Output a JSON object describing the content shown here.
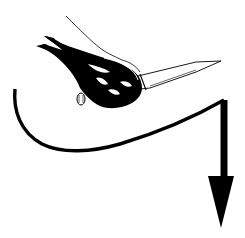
{
  "image": {
    "description": "Pictogram: hand gripping a knife with a curved path arrow sweeping down",
    "colors": {
      "background": "#ffffff",
      "ink": "#000000"
    },
    "elements": [
      {
        "name": "hand",
        "style": "black silhouette with white highlights"
      },
      {
        "name": "knife",
        "style": "outlined blade pointing right"
      },
      {
        "name": "path-arrow",
        "style": "thick curve ending in downward arrowhead"
      }
    ]
  }
}
